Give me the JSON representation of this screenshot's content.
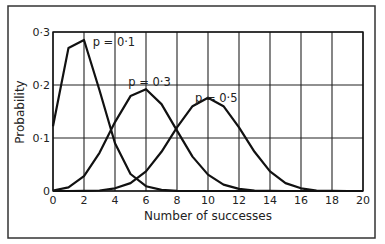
{
  "chart_data": {
    "type": "line",
    "title": "",
    "xlabel": "Number of successes",
    "ylabel": "Probability",
    "xlim": [
      0,
      20
    ],
    "ylim": [
      0,
      0.3
    ],
    "grid": true,
    "x_ticks": [
      "0",
      "2",
      "4",
      "6",
      "8",
      "10",
      "12",
      "14",
      "16",
      "18",
      "20"
    ],
    "y_ticks": [
      "0",
      "0·1",
      "0·2",
      "0·3"
    ],
    "x": [
      0,
      1,
      2,
      3,
      4,
      5,
      6,
      7,
      8,
      9,
      10,
      11,
      12,
      13,
      14,
      15,
      16,
      17,
      18,
      19,
      20
    ],
    "series": [
      {
        "name": "p = 0·1",
        "values": [
          0.122,
          0.27,
          0.285,
          0.19,
          0.09,
          0.032,
          0.009,
          0.002,
          0.0004,
          0,
          0,
          0,
          0,
          0,
          0,
          0,
          0,
          0,
          0,
          0,
          0
        ]
      },
      {
        "name": "p = 0·3",
        "values": [
          0.001,
          0.007,
          0.028,
          0.072,
          0.13,
          0.179,
          0.192,
          0.164,
          0.114,
          0.065,
          0.031,
          0.012,
          0.004,
          0.001,
          0.0002,
          0,
          0,
          0,
          0,
          0,
          0
        ]
      },
      {
        "name": "p = 0·5",
        "values": [
          0,
          0,
          0.0002,
          0.001,
          0.005,
          0.015,
          0.037,
          0.074,
          0.12,
          0.16,
          0.176,
          0.16,
          0.12,
          0.074,
          0.037,
          0.015,
          0.005,
          0.001,
          0.0002,
          0,
          0
        ]
      }
    ],
    "annotations": [
      {
        "text": "p = 0·1",
        "x": 2.3,
        "y": 0.285
      },
      {
        "text": "p = 0·3",
        "x": 4.6,
        "y": 0.21
      },
      {
        "text": "p = 0·5",
        "x": 8.9,
        "y": 0.18
      }
    ]
  }
}
